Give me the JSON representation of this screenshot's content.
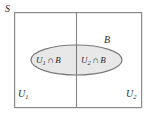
{
  "figure": {
    "background_color": "#ffffff"
  },
  "labels": {
    "sample_space": "S",
    "left_partition": "U",
    "left_partition_sub": "1",
    "right_partition": "U",
    "right_partition_sub": "2",
    "event": "B",
    "left_region_set": "U",
    "left_region_sub": "1",
    "left_region_op": "∩",
    "left_region_event": "B",
    "right_region_set": "U",
    "right_region_sub": "2",
    "right_region_op": "∩",
    "right_region_event": "B"
  },
  "shapes": {
    "rectangle": {
      "name": "sample-space-rectangle",
      "x": 14,
      "y": 12,
      "width": 128,
      "height": 96,
      "stroke": "#8a8a8a",
      "fill": "#ffffff",
      "stroke_width": 1.2
    },
    "divider": {
      "name": "partition-divider-line",
      "x": 76,
      "y1": 12,
      "y2": 108,
      "stroke": "#8a8a8a",
      "stroke_width": 1.2
    },
    "ellipse": {
      "name": "event-b-ellipse",
      "cx": 76.5,
      "cy": 60,
      "rx": 45.5,
      "ry": 15,
      "stroke": "#7a7a7a",
      "fill": "#e8e8e8",
      "stroke_width": 1.2
    }
  },
  "colors": {
    "outline": "#8a8a8a",
    "ellipse_fill": "#e8e8e8",
    "ellipse_stroke": "#7a7a7a",
    "text": "#2b2b2b",
    "background": "#ffffff"
  }
}
